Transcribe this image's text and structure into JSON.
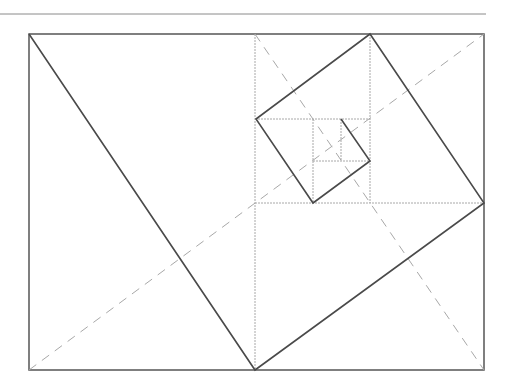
{
  "diagram": {
    "title": "",
    "colors": {
      "background": "#ffffff",
      "frame": "#555555",
      "solid": "#4a4a4a",
      "dashed": "#a8a8a8",
      "rule": "#8a8a8a"
    },
    "top_rule": {
      "x1": 0,
      "y1": 14,
      "x2": 486,
      "y2": 14
    },
    "outer_rect": {
      "x": 29,
      "y": 34,
      "width": 455,
      "height": 336
    },
    "subdivisions": [
      {
        "x1": 255,
        "y1": 34,
        "x2": 255,
        "y2": 370
      },
      {
        "x1": 255,
        "y1": 203,
        "x2": 484,
        "y2": 203
      },
      {
        "x1": 370,
        "y1": 34,
        "x2": 370,
        "y2": 203
      },
      {
        "x1": 255,
        "y1": 119,
        "x2": 370,
        "y2": 119
      },
      {
        "x1": 313,
        "y1": 119,
        "x2": 313,
        "y2": 203
      },
      {
        "x1": 313,
        "y1": 161,
        "x2": 370,
        "y2": 161
      },
      {
        "x1": 341,
        "y1": 119,
        "x2": 341,
        "y2": 161
      }
    ],
    "diagonals": [
      {
        "x1": 29,
        "y1": 370,
        "x2": 484,
        "y2": 34
      },
      {
        "x1": 255,
        "y1": 34,
        "x2": 484,
        "y2": 370
      }
    ],
    "spiral_points": "29,34 255,370 484,203 370,34 256,119 313,203 370,161 341,119"
  }
}
